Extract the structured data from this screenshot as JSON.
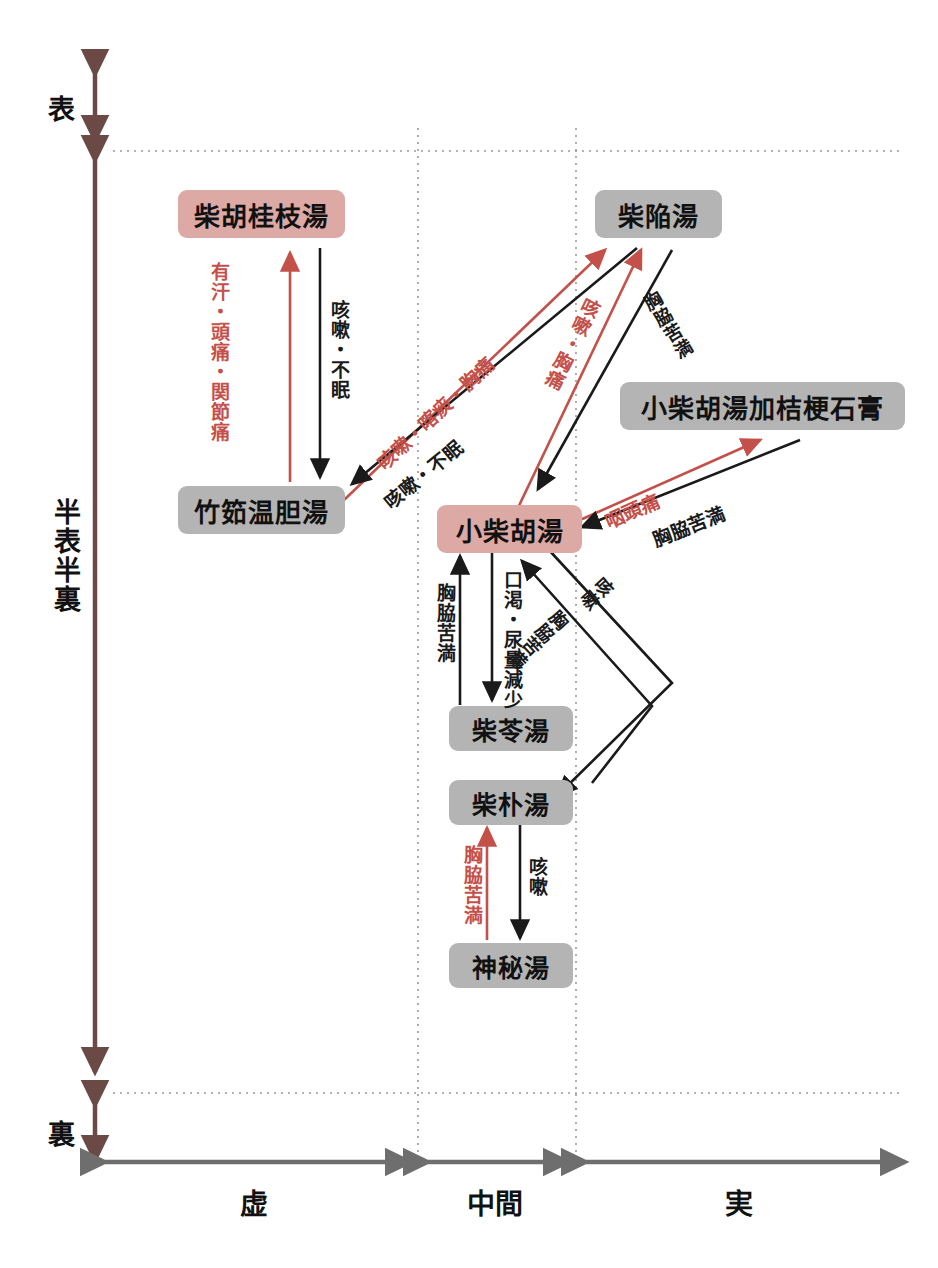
{
  "diagram": {
    "title_present": false,
    "colors": {
      "pink_node": "#dda9a4",
      "gray_node": "#b4b4b4",
      "red_arrow": "#c4504a",
      "black_arrow": "#1a1a1a",
      "axis_brown": "#6b4a45",
      "axis_gray": "#6e6e6e",
      "grid_dotted": "#9a9a9a"
    },
    "y_axis": {
      "name": "表裏 (depth axis)",
      "segments": [
        {
          "id": "hyo",
          "label": "表"
        },
        {
          "id": "hanpyo-hanri",
          "label": "半表半裏"
        },
        {
          "id": "ri",
          "label": "裏"
        }
      ]
    },
    "x_axis": {
      "name": "虚実 (strength axis)",
      "segments": [
        {
          "id": "kyo",
          "label": "虚"
        },
        {
          "id": "chukan",
          "label": "中間"
        },
        {
          "id": "jitsu",
          "label": "実"
        }
      ]
    },
    "nodes": [
      {
        "id": "saiko-keishi-to",
        "label": "柴胡桂枝湯",
        "style": "pink"
      },
      {
        "id": "saikan-to",
        "label": "柴陥湯",
        "style": "gray"
      },
      {
        "id": "chikujo-untan-to",
        "label": "竹筎温胆湯",
        "style": "gray"
      },
      {
        "id": "shosaiko-to-ka-kikyo-sekko",
        "label": "小柴胡湯加桔梗石膏",
        "style": "gray"
      },
      {
        "id": "shosaiko-to",
        "label": "小柴胡湯",
        "style": "pink"
      },
      {
        "id": "sairei-to",
        "label": "柴苓湯",
        "style": "gray"
      },
      {
        "id": "saiboku-to",
        "label": "柴朴湯",
        "style": "gray"
      },
      {
        "id": "shinpi-to",
        "label": "神秘湯",
        "style": "gray"
      }
    ],
    "edges": [
      {
        "id": "e1",
        "from": "chikujo-untan-to",
        "to": "saiko-keishi-to",
        "color": "red",
        "label": "有汗・頭痛・関節痛"
      },
      {
        "id": "e2",
        "from": "saiko-keishi-to",
        "to": "chikujo-untan-to",
        "color": "black",
        "label": "咳嗽・不眠"
      },
      {
        "id": "e3",
        "from": "chikujo-untan-to",
        "to": "saikan-to",
        "color": "red",
        "label": "咳嗽・喀痰・胸痛"
      },
      {
        "id": "e4",
        "from": "saikan-to",
        "to": "chikujo-untan-to",
        "color": "black",
        "label": "咳嗽・不眠"
      },
      {
        "id": "e5",
        "from": "shosaiko-to",
        "to": "saikan-to",
        "color": "red",
        "label": "咳嗽・胸痛"
      },
      {
        "id": "e6",
        "from": "saikan-to",
        "to": "shosaiko-to",
        "color": "black",
        "label": "胸脇苦満"
      },
      {
        "id": "e7",
        "from": "shosaiko-to",
        "to": "shosaiko-to-ka-kikyo-sekko",
        "color": "red",
        "label": "咽頭痛"
      },
      {
        "id": "e8",
        "from": "shosaiko-to-ka-kikyo-sekko",
        "to": "shosaiko-to",
        "color": "black",
        "label": "胸脇苦満"
      },
      {
        "id": "e9",
        "from": "shosaiko-to",
        "to": "sairei-to",
        "color": "black",
        "label": "口渇・尿量減少"
      },
      {
        "id": "e10",
        "from": "sairei-to",
        "to": "shosaiko-to",
        "color": "black",
        "label": "胸脇苦満"
      },
      {
        "id": "e11",
        "from": "shosaiko-to",
        "to": "saiboku-to",
        "color": "black",
        "label": "咳嗽"
      },
      {
        "id": "e12",
        "from": "saiboku-to",
        "to": "shosaiko-to",
        "color": "black",
        "label": "胸脇苦満"
      },
      {
        "id": "e13",
        "from": "shinpi-to",
        "to": "saiboku-to",
        "color": "red",
        "label": "胸脇苦満"
      },
      {
        "id": "e14",
        "from": "saiboku-to",
        "to": "shinpi-to",
        "color": "black",
        "label": "咳嗽"
      }
    ]
  }
}
